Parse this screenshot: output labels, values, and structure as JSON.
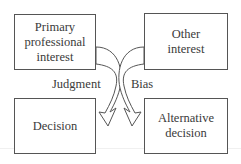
{
  "diagram": {
    "boxes": {
      "primary_interest": {
        "lines": [
          "Primary",
          "professional",
          "interest"
        ]
      },
      "other_interest": {
        "lines": [
          "Other",
          "interest"
        ]
      },
      "decision": {
        "lines": [
          "Decision"
        ]
      },
      "alternative_decision": {
        "lines": [
          "Alternative",
          "decision"
        ]
      }
    },
    "arrows": {
      "judgment": {
        "label": "Judgment",
        "from": "primary_interest",
        "to": "decision"
      },
      "bias": {
        "label": "Bias",
        "from": "other_interest",
        "to": "alternative_decision"
      }
    },
    "colors": {
      "stroke": "#555555",
      "text": "#3a3a3a",
      "background": "#ffffff"
    }
  }
}
